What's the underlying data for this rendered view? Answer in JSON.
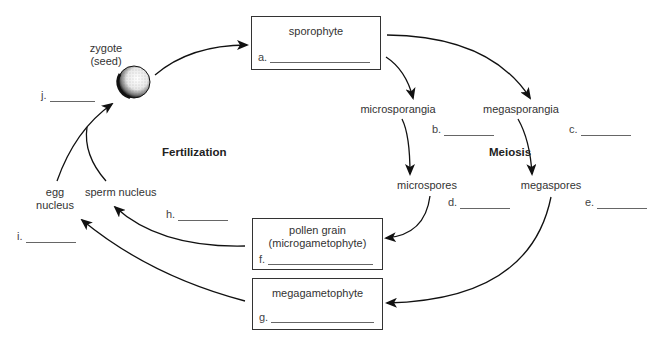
{
  "diagram": {
    "type": "plant life cycle (seed plant alternation of generations)",
    "process_labels": {
      "fertilization": "Fertilization",
      "meiosis": "Meiosis"
    },
    "nodes": {
      "zygote": {
        "line1": "zygote",
        "line2": "(seed)"
      },
      "sporophyte": {
        "title": "sporophyte",
        "blank_letter": "a."
      },
      "microsporangia": {
        "label": "microsporangia"
      },
      "megasporangia": {
        "label": "megasporangia"
      },
      "microspores": {
        "label": "microspores"
      },
      "megaspores": {
        "label": "megaspores"
      },
      "pollen_grain": {
        "line1": "pollen grain",
        "line2": "(microgametophyte)",
        "blank_letter": "f."
      },
      "megagametophyte": {
        "title": "megagametophyte",
        "blank_letter": "g."
      },
      "sperm_nucleus": {
        "label": "sperm nucleus"
      },
      "egg_nucleus": {
        "line1": "egg",
        "line2": "nucleus"
      }
    },
    "blanks": {
      "b": "b.",
      "c": "c.",
      "d": "d.",
      "e": "e.",
      "h": "h.",
      "i": "i.",
      "j": "j."
    },
    "arrows": [
      {
        "from": "zygote",
        "to": "sporophyte"
      },
      {
        "from": "sporophyte",
        "to": "microsporangia"
      },
      {
        "from": "sporophyte",
        "to": "megasporangia"
      },
      {
        "from": "microsporangia",
        "to": "microspores"
      },
      {
        "from": "megasporangia",
        "to": "megaspores"
      },
      {
        "from": "microspores",
        "to": "pollen_grain"
      },
      {
        "from": "megaspores",
        "to": "megagametophyte"
      },
      {
        "from": "pollen_grain",
        "to": "sperm_nucleus"
      },
      {
        "from": "megagametophyte",
        "to": "egg_nucleus"
      },
      {
        "from": "egg_nucleus",
        "to": "zygote"
      },
      {
        "from": "sperm_nucleus",
        "to": "zygote"
      }
    ],
    "colors": {
      "ink": "#222222",
      "background": "#ffffff"
    }
  }
}
